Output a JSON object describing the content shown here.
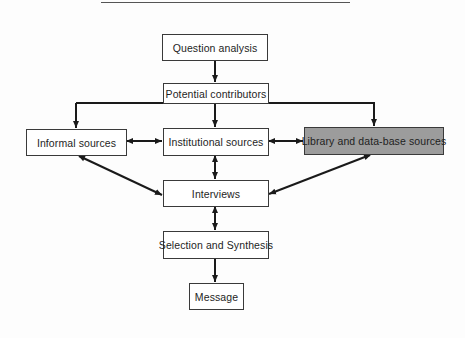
{
  "diagram": {
    "type": "flowchart",
    "colors": {
      "line": "#1a1a1a",
      "box_border": "#3a3a3a",
      "box_fill": "#ffffff",
      "highlight_fill": "#9c9c9c"
    },
    "nodes": {
      "question_analysis": "Question analysis",
      "potential_contributors": "Potential contributors",
      "informal_sources": "Informal sources",
      "institutional_sources": "Institutional sources",
      "library_sources": "Library and data-base sources",
      "interviews": "Interviews",
      "selection_synthesis": "Selection and Synthesis",
      "message": "Message"
    },
    "edges": [
      {
        "from": "Question analysis",
        "to": "Potential contributors",
        "direction": "one-way"
      },
      {
        "from": "Potential contributors",
        "to": "Informal sources",
        "direction": "one-way"
      },
      {
        "from": "Potential contributors",
        "to": "Institutional sources",
        "direction": "one-way"
      },
      {
        "from": "Potential contributors",
        "to": "Library and data-base sources",
        "direction": "one-way"
      },
      {
        "from": "Informal sources",
        "to": "Institutional sources",
        "direction": "two-way"
      },
      {
        "from": "Institutional sources",
        "to": "Library and data-base sources",
        "direction": "two-way"
      },
      {
        "from": "Informal sources",
        "to": "Interviews",
        "direction": "two-way"
      },
      {
        "from": "Institutional sources",
        "to": "Interviews",
        "direction": "two-way"
      },
      {
        "from": "Library and data-base sources",
        "to": "Interviews",
        "direction": "two-way"
      },
      {
        "from": "Interviews",
        "to": "Selection and Synthesis",
        "direction": "two-way"
      },
      {
        "from": "Selection and Synthesis",
        "to": "Message",
        "direction": "one-way"
      }
    ]
  }
}
